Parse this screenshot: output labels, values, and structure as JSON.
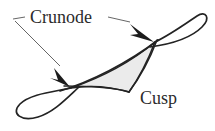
{
  "figure": {
    "background_color": "#ffffff",
    "curve_color": "#232323",
    "leader_color": "#555555",
    "shaded_region_fill": "#ebebeb",
    "shaded_region_stroke": "#232323",
    "labels": {
      "crunode": "Crunode",
      "cusp": "Cusp"
    },
    "annotations": [
      {
        "name": "crunode-upper",
        "label": "Crunode",
        "point_x": 155,
        "point_y": 42,
        "description": "upper self-intersection point of the curve"
      },
      {
        "name": "crunode-lower",
        "label": "Crunode",
        "point_x": 71,
        "point_y": 88,
        "description": "lower self-intersection point of the curve"
      },
      {
        "name": "cusp-point",
        "label": "Cusp",
        "point_x": 128,
        "point_y": 92,
        "description": "sharp corner of the shaded region"
      }
    ],
    "geometry": {
      "curve_stroke_width": 1.6,
      "leader_stroke_width": 0.9,
      "arrowhead_count": 2,
      "loop_count": 2
    }
  }
}
